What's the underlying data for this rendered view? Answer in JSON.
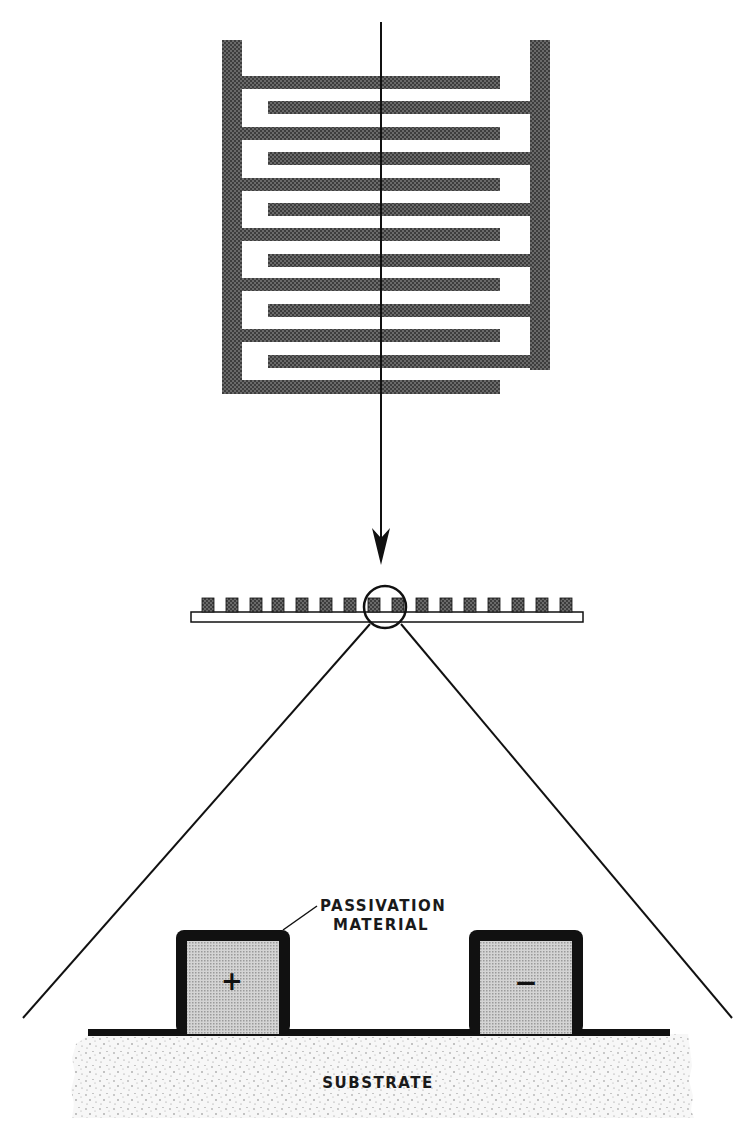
{
  "figure": {
    "colors": {
      "metal_fill": "#4a4a4a",
      "passivation": "#111111",
      "electrode_core": "#c8c8c8",
      "substrate": "#f2f2f2",
      "line": "#111111",
      "background": "#ffffff"
    }
  },
  "plan_view": {
    "name": "interdigitated-comb-electrode",
    "left_fingers": 7,
    "right_fingers": 6
  },
  "side_view": {
    "name": "electrode-array-cross-section",
    "electrode_count": 16
  },
  "magnified_view": {
    "labels": {
      "passivation": [
        "PASSIVATION",
        "MATERIAL"
      ],
      "substrate": "SUBSTRATE",
      "positive": "+",
      "negative": "−"
    }
  }
}
